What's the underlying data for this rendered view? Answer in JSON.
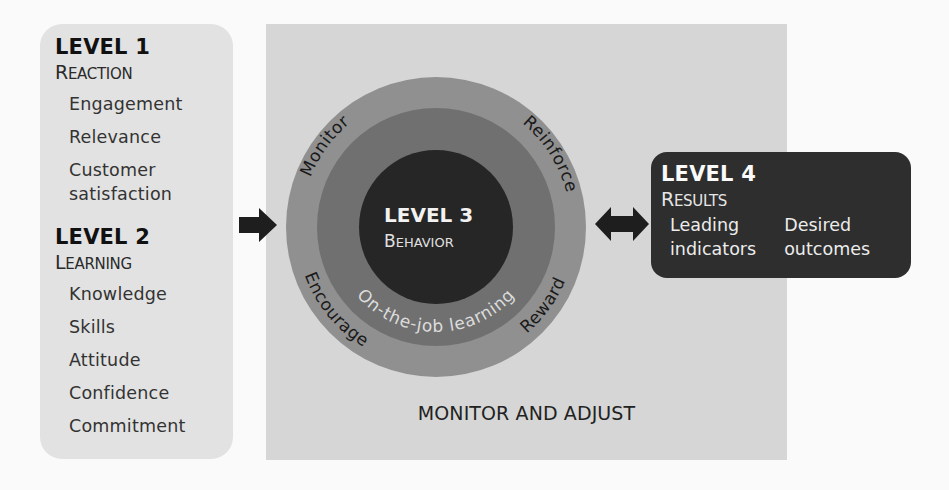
{
  "colors": {
    "page_bg": "#fafafa",
    "left_box_bg": "#e2e2e2",
    "panel_bg": "#d6d6d6",
    "outer_ring": "#909090",
    "middle_ring": "#707070",
    "inner_circle": "#262626",
    "level4_bg": "#2e2e2e",
    "arrow": "#1e1e1e"
  },
  "level1": {
    "title": "LEVEL 1",
    "subtitle_cap": "R",
    "subtitle_rest": "EACTION",
    "items": [
      "Engagement",
      "Relevance",
      "Customer satisfaction"
    ]
  },
  "level2": {
    "title": "LEVEL 2",
    "subtitle_cap": "L",
    "subtitle_rest": "EARNING",
    "items": [
      "Knowledge",
      "Skills",
      "Attitude",
      "Confidence",
      "Commitment"
    ]
  },
  "level3": {
    "title": "LEVEL 3",
    "subtitle_cap": "B",
    "subtitle_rest": "EHAVIOR",
    "inner_ring_label": "On-the-job learning",
    "outer_ring_labels": {
      "top_left": "Monitor",
      "top_right": "Reinforce",
      "bottom_left": "Encourage",
      "bottom_right": "Reward"
    }
  },
  "level4": {
    "title": "LEVEL 4",
    "subtitle_cap": "R",
    "subtitle_rest": "ESULTS",
    "columns": [
      [
        "Leading",
        "indicators"
      ],
      [
        "Desired",
        "outcomes"
      ]
    ]
  },
  "panel": {
    "caption": "MONITOR AND ADJUST"
  },
  "icons": {
    "left_arrow": "right-arrow-icon",
    "right_arrow": "double-arrow-icon"
  }
}
